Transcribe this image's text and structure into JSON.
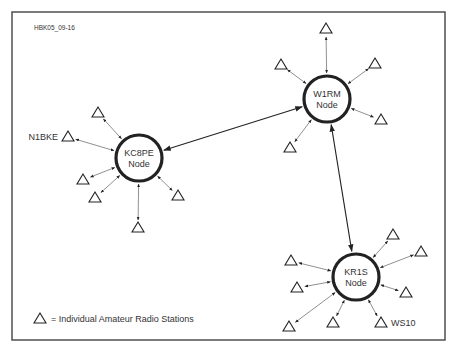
{
  "figure_id": "HBK05_09-16",
  "legend": {
    "symbol": "triangle",
    "text": "= Individual Amateur Radio Stations"
  },
  "colors": {
    "line": "#222222",
    "frame": "#444444",
    "text": "#333333",
    "background": "#ffffff"
  },
  "nodes": [
    {
      "id": "KC8PE",
      "line1": "KC8PE",
      "line2": "Node",
      "cx": 139,
      "cy": 158,
      "r": 23
    },
    {
      "id": "W1RM",
      "line1": "W1RM",
      "line2": "Node",
      "cx": 327,
      "cy": 99,
      "r": 23
    },
    {
      "id": "KR1S",
      "line1": "KR1S",
      "line2": "Node",
      "cx": 356,
      "cy": 277,
      "r": 23
    }
  ],
  "node_links": [
    [
      "KC8PE",
      "W1RM"
    ],
    [
      "W1RM",
      "KR1S"
    ]
  ],
  "stations": [
    {
      "node": "KC8PE",
      "x": 98,
      "y": 112,
      "label": ""
    },
    {
      "node": "KC8PE",
      "x": 68,
      "y": 136,
      "label": "N1BKE"
    },
    {
      "node": "KC8PE",
      "x": 83,
      "y": 179,
      "label": ""
    },
    {
      "node": "KC8PE",
      "x": 95,
      "y": 197,
      "label": ""
    },
    {
      "node": "KC8PE",
      "x": 178,
      "y": 195,
      "label": ""
    },
    {
      "node": "KC8PE",
      "x": 138,
      "y": 227,
      "label": ""
    },
    {
      "node": "W1RM",
      "x": 326,
      "y": 28,
      "label": ""
    },
    {
      "node": "W1RM",
      "x": 281,
      "y": 64,
      "label": ""
    },
    {
      "node": "W1RM",
      "x": 375,
      "y": 63,
      "label": ""
    },
    {
      "node": "W1RM",
      "x": 381,
      "y": 119,
      "label": ""
    },
    {
      "node": "W1RM",
      "x": 290,
      "y": 147,
      "label": ""
    },
    {
      "node": "KR1S",
      "x": 393,
      "y": 234,
      "label": ""
    },
    {
      "node": "KR1S",
      "x": 421,
      "y": 251,
      "label": ""
    },
    {
      "node": "KR1S",
      "x": 291,
      "y": 260,
      "label": ""
    },
    {
      "node": "KR1S",
      "x": 297,
      "y": 287,
      "label": ""
    },
    {
      "node": "KR1S",
      "x": 406,
      "y": 292,
      "label": ""
    },
    {
      "node": "KR1S",
      "x": 289,
      "y": 326,
      "label": ""
    },
    {
      "node": "KR1S",
      "x": 333,
      "y": 322,
      "label": ""
    },
    {
      "node": "KR1S",
      "x": 381,
      "y": 322,
      "label": "WS10"
    }
  ]
}
